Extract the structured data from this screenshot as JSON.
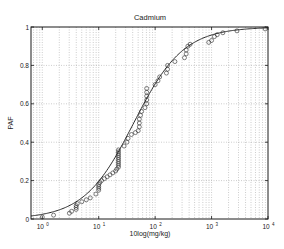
{
  "chart_data": {
    "type": "scatter",
    "title": "Cadmium",
    "xlabel": "10log(mg/kg)",
    "ylabel": "PAF",
    "xscale": "log",
    "xlim_log10": [
      -0.2,
      4.0
    ],
    "ylim": [
      0,
      1
    ],
    "grid": true,
    "legend": null,
    "x_ticks": [
      {
        "exp": 0,
        "label": "10",
        "sup": "0"
      },
      {
        "exp": 1,
        "label": "10",
        "sup": "1"
      },
      {
        "exp": 2,
        "label": "10",
        "sup": "2"
      },
      {
        "exp": 3,
        "label": "10",
        "sup": "3"
      },
      {
        "exp": 4,
        "label": "10",
        "sup": "4"
      }
    ],
    "y_ticks": [
      {
        "v": 0,
        "label": "0"
      },
      {
        "v": 0.2,
        "label": "0.2"
      },
      {
        "v": 0.4,
        "label": "0.4"
      },
      {
        "v": 0.6,
        "label": "0.6"
      },
      {
        "v": 0.8,
        "label": "0.8"
      },
      {
        "v": 1,
        "label": "1"
      }
    ],
    "fitted_curve": {
      "name": "Log-logistic fit",
      "model": "logistic in log10(x)",
      "midpoint_log10": 1.62,
      "scale": 0.44
    },
    "series": [
      {
        "name": "Species sensitivity data",
        "marker": "open-circle",
        "points_log10x_paf": [
          [
            0.0,
            0.01
          ],
          [
            0.2,
            0.02
          ],
          [
            0.48,
            0.03
          ],
          [
            0.52,
            0.04
          ],
          [
            0.6,
            0.05
          ],
          [
            0.6,
            0.06
          ],
          [
            0.6,
            0.07
          ],
          [
            0.62,
            0.08
          ],
          [
            0.7,
            0.09
          ],
          [
            0.78,
            0.1
          ],
          [
            0.85,
            0.11
          ],
          [
            0.95,
            0.13
          ],
          [
            1.0,
            0.15
          ],
          [
            1.0,
            0.16
          ],
          [
            1.0,
            0.17
          ],
          [
            1.0,
            0.18
          ],
          [
            1.02,
            0.19
          ],
          [
            1.05,
            0.2
          ],
          [
            1.1,
            0.21
          ],
          [
            1.15,
            0.22
          ],
          [
            1.2,
            0.23
          ],
          [
            1.25,
            0.24
          ],
          [
            1.3,
            0.25
          ],
          [
            1.32,
            0.26
          ],
          [
            1.35,
            0.27
          ],
          [
            1.35,
            0.28
          ],
          [
            1.35,
            0.29
          ],
          [
            1.35,
            0.3
          ],
          [
            1.35,
            0.31
          ],
          [
            1.35,
            0.32
          ],
          [
            1.35,
            0.33
          ],
          [
            1.35,
            0.34
          ],
          [
            1.35,
            0.35
          ],
          [
            1.35,
            0.36
          ],
          [
            1.45,
            0.38
          ],
          [
            1.5,
            0.4
          ],
          [
            1.52,
            0.42
          ],
          [
            1.58,
            0.44
          ],
          [
            1.65,
            0.45
          ],
          [
            1.7,
            0.46
          ],
          [
            1.72,
            0.48
          ],
          [
            1.72,
            0.5
          ],
          [
            1.72,
            0.52
          ],
          [
            1.74,
            0.54
          ],
          [
            1.76,
            0.56
          ],
          [
            1.82,
            0.58
          ],
          [
            1.85,
            0.6
          ],
          [
            1.85,
            0.62
          ],
          [
            1.85,
            0.64
          ],
          [
            1.85,
            0.66
          ],
          [
            1.85,
            0.68
          ],
          [
            2.0,
            0.7
          ],
          [
            2.05,
            0.72
          ],
          [
            2.08,
            0.74
          ],
          [
            2.2,
            0.76
          ],
          [
            2.22,
            0.78
          ],
          [
            2.22,
            0.8
          ],
          [
            2.35,
            0.82
          ],
          [
            2.52,
            0.84
          ],
          [
            2.55,
            0.86
          ],
          [
            2.55,
            0.88
          ],
          [
            2.58,
            0.9
          ],
          [
            2.62,
            0.91
          ],
          [
            2.95,
            0.92
          ],
          [
            3.0,
            0.93
          ],
          [
            3.05,
            0.95
          ],
          [
            3.1,
            0.96
          ],
          [
            3.2,
            0.97
          ],
          [
            3.45,
            0.98
          ],
          [
            3.95,
            0.99
          ]
        ]
      }
    ]
  },
  "colors": {
    "axes": "#1a1a1a",
    "grid": "#9a9a9a",
    "curve": "#2a2a2a",
    "marker": "#2a2a2a",
    "background": "#ffffff"
  }
}
